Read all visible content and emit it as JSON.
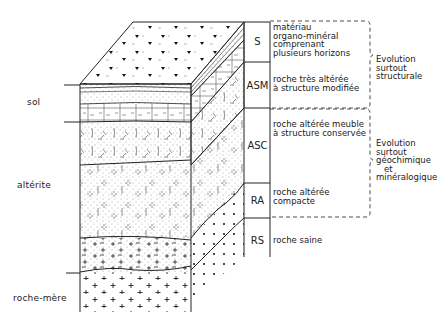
{
  "diagram": {
    "type": "soil-profile-block-diagram",
    "left_labels": [
      {
        "id": "sol",
        "text": "sol"
      },
      {
        "id": "alterite",
        "text": "altérite"
      },
      {
        "id": "roche-mere",
        "text": "roche-mère"
      }
    ],
    "horizons": [
      {
        "code": "S",
        "description": "matériau\norgano-minéral\ncomprenant\nplusieurs horizons"
      },
      {
        "code": "ASM",
        "description": "roche très altérée\nà structure modifiée"
      },
      {
        "code": "ASC",
        "description": "roche altérée meuble\nà structure conservée"
      },
      {
        "code": "RA",
        "description": "roche altérée\ncompacte"
      },
      {
        "code": "RS",
        "description": "roche saine"
      }
    ],
    "evolution_groups": [
      {
        "id": "structural",
        "text": "Evolution\nsurtout\nstructurale",
        "spans": [
          "S",
          "ASM"
        ]
      },
      {
        "id": "geochemical",
        "text": "Evolution\nsurtout\ngéochimique\n   et\nminéralogique",
        "spans": [
          "ASC",
          "RA"
        ]
      }
    ],
    "colors": {
      "ink": "#222222",
      "background": "#ffffff"
    }
  }
}
